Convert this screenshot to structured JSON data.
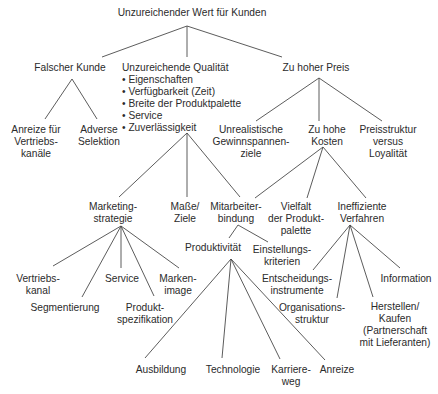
{
  "diagram": {
    "type": "issue-tree",
    "root": {
      "label": "Unzureichender Wert für Kunden"
    },
    "nodes": [
      {
        "id": "root",
        "lines": [
          "Unzureichender Wert für Kunden"
        ],
        "x": 192,
        "y": 16,
        "anchor": "middle"
      },
      {
        "id": "falscher-kunde",
        "lines": [
          "Falscher Kunde"
        ],
        "x": 70,
        "y": 71,
        "anchor": "middle"
      },
      {
        "id": "qualitaet",
        "lines": [
          "Unzureichende Qualität"
        ],
        "x": 122,
        "y": 71,
        "anchor": "start"
      },
      {
        "id": "qualitaet-bullets",
        "lines": [
          "• Eigenschaften",
          "• Verfügbarkeit (Zeit)",
          "• Breite der Produktpalette",
          "• Service",
          "• Zuverlässigkeit"
        ],
        "x": 122,
        "y": 83,
        "anchor": "start"
      },
      {
        "id": "preis",
        "lines": [
          "Zu hoher Preis"
        ],
        "x": 316,
        "y": 71,
        "anchor": "middle"
      },
      {
        "id": "anreize-vertrieb",
        "lines": [
          "Anreize für",
          "Vertriebs-",
          "kanäle"
        ],
        "x": 36,
        "y": 133,
        "anchor": "middle"
      },
      {
        "id": "adverse",
        "lines": [
          "Adverse",
          "Selektion"
        ],
        "x": 99,
        "y": 133,
        "anchor": "middle"
      },
      {
        "id": "gewinn",
        "lines": [
          "Unrealistische",
          "Gewinnspannen-",
          "ziele"
        ],
        "x": 251,
        "y": 133,
        "anchor": "middle"
      },
      {
        "id": "kosten",
        "lines": [
          "Zu hohe",
          "Kosten"
        ],
        "x": 327,
        "y": 133,
        "anchor": "middle"
      },
      {
        "id": "preisstruktur",
        "lines": [
          "Preisstruktur",
          "versus",
          "Loyalität"
        ],
        "x": 388,
        "y": 133,
        "anchor": "middle"
      },
      {
        "id": "marketing",
        "lines": [
          "Marketing-",
          "strategie"
        ],
        "x": 113,
        "y": 210,
        "anchor": "middle"
      },
      {
        "id": "masse",
        "lines": [
          "Maße/",
          "Ziele"
        ],
        "x": 185,
        "y": 210,
        "anchor": "middle"
      },
      {
        "id": "mitarbeiter",
        "lines": [
          "Mitarbeiter-",
          "bindung"
        ],
        "x": 236,
        "y": 210,
        "anchor": "middle"
      },
      {
        "id": "vielfalt",
        "lines": [
          "Vielfalt",
          "der Produkt-",
          "palette"
        ],
        "x": 296,
        "y": 210,
        "anchor": "middle"
      },
      {
        "id": "verfahren",
        "lines": [
          "Ineffiziente",
          "Verfahren"
        ],
        "x": 362,
        "y": 210,
        "anchor": "middle"
      },
      {
        "id": "produktivitaet",
        "lines": [
          "Produktivität"
        ],
        "x": 213,
        "y": 251,
        "anchor": "middle"
      },
      {
        "id": "einstellung",
        "lines": [
          "Einstellungs-",
          "kriterien"
        ],
        "x": 282,
        "y": 253,
        "anchor": "middle"
      },
      {
        "id": "vertriebskanal",
        "lines": [
          "Vertriebs-",
          "kanal"
        ],
        "x": 38,
        "y": 282,
        "anchor": "middle"
      },
      {
        "id": "segmentierung",
        "lines": [
          "Segmentierung"
        ],
        "x": 65,
        "y": 311,
        "anchor": "middle"
      },
      {
        "id": "service",
        "lines": [
          "Service"
        ],
        "x": 122,
        "y": 282,
        "anchor": "middle"
      },
      {
        "id": "produktspez",
        "lines": [
          "Produkt-",
          "spezifikation"
        ],
        "x": 145,
        "y": 311,
        "anchor": "middle"
      },
      {
        "id": "markenimage",
        "lines": [
          "Marken-",
          "image"
        ],
        "x": 178,
        "y": 282,
        "anchor": "middle"
      },
      {
        "id": "entscheidung",
        "lines": [
          "Entscheidungs-",
          "instrumente"
        ],
        "x": 297,
        "y": 282,
        "anchor": "middle"
      },
      {
        "id": "organisation",
        "lines": [
          "Organisations-",
          "struktur"
        ],
        "x": 312,
        "y": 311,
        "anchor": "middle"
      },
      {
        "id": "information",
        "lines": [
          "Information"
        ],
        "x": 406,
        "y": 282,
        "anchor": "middle"
      },
      {
        "id": "herstellen",
        "lines": [
          "Herstellen/",
          "Kaufen",
          "(Partnerschaft",
          "mit Lieferanten)"
        ],
        "x": 395,
        "y": 310,
        "anchor": "middle"
      },
      {
        "id": "ausbildung",
        "lines": [
          "Ausbildung"
        ],
        "x": 161,
        "y": 373,
        "anchor": "middle"
      },
      {
        "id": "technologie",
        "lines": [
          "Technologie"
        ],
        "x": 233,
        "y": 373,
        "anchor": "middle"
      },
      {
        "id": "karriere",
        "lines": [
          "Karriere-",
          "weg"
        ],
        "x": 291,
        "y": 373,
        "anchor": "middle"
      },
      {
        "id": "anreize",
        "lines": [
          "Anreize"
        ],
        "x": 337,
        "y": 373,
        "anchor": "middle"
      }
    ],
    "edges": [
      {
        "from": "root",
        "to": "falscher-kunde",
        "x1": 187,
        "y1": 26,
        "x2": 102,
        "y2": 57
      },
      {
        "from": "root",
        "to": "qualitaet",
        "x1": 187,
        "y1": 26,
        "x2": 187,
        "y2": 57
      },
      {
        "from": "root",
        "to": "preis",
        "x1": 187,
        "y1": 26,
        "x2": 282,
        "y2": 57
      },
      {
        "from": "falscher-kunde",
        "to": "anreize-vertrieb",
        "x1": 72,
        "y1": 79,
        "x2": 45,
        "y2": 119
      },
      {
        "from": "falscher-kunde",
        "to": "adverse",
        "x1": 72,
        "y1": 79,
        "x2": 97,
        "y2": 119
      },
      {
        "from": "preis",
        "to": "gewinn",
        "x1": 319,
        "y1": 78,
        "x2": 256,
        "y2": 121
      },
      {
        "from": "preis",
        "to": "kosten",
        "x1": 319,
        "y1": 78,
        "x2": 319,
        "y2": 121
      },
      {
        "from": "preis",
        "to": "preisstruktur",
        "x1": 319,
        "y1": 78,
        "x2": 382,
        "y2": 121
      },
      {
        "from": "qualitaet",
        "to": "marketing",
        "x1": 187,
        "y1": 133,
        "x2": 119,
        "y2": 197
      },
      {
        "from": "qualitaet",
        "to": "masse",
        "x1": 187,
        "y1": 133,
        "x2": 187,
        "y2": 197
      },
      {
        "from": "qualitaet",
        "to": "mitarbeiter",
        "x1": 187,
        "y1": 133,
        "x2": 240,
        "y2": 197
      },
      {
        "from": "kosten",
        "to": "mitarbeiter",
        "x1": 323,
        "y1": 147,
        "x2": 255,
        "y2": 198
      },
      {
        "from": "kosten",
        "to": "vielfalt",
        "x1": 323,
        "y1": 147,
        "x2": 307,
        "y2": 198
      },
      {
        "from": "kosten",
        "to": "verfahren",
        "x1": 323,
        "y1": 147,
        "x2": 366,
        "y2": 198
      },
      {
        "from": "mitarbeiter",
        "to": "produktivitaet",
        "x1": 238,
        "y1": 225,
        "x2": 229,
        "y2": 238
      },
      {
        "from": "mitarbeiter",
        "to": "einstellung",
        "x1": 238,
        "y1": 225,
        "x2": 268,
        "y2": 242
      },
      {
        "from": "marketing",
        "to": "vertriebskanal",
        "x1": 121,
        "y1": 226,
        "x2": 53,
        "y2": 266
      },
      {
        "from": "marketing",
        "to": "segmentierung",
        "x1": 121,
        "y1": 226,
        "x2": 82,
        "y2": 297
      },
      {
        "from": "marketing",
        "to": "service",
        "x1": 121,
        "y1": 226,
        "x2": 121,
        "y2": 268
      },
      {
        "from": "marketing",
        "to": "produktspez",
        "x1": 121,
        "y1": 226,
        "x2": 154,
        "y2": 296
      },
      {
        "from": "marketing",
        "to": "markenimage",
        "x1": 121,
        "y1": 226,
        "x2": 179,
        "y2": 268
      },
      {
        "from": "verfahren",
        "to": "entscheidung",
        "x1": 350,
        "y1": 225,
        "x2": 313,
        "y2": 270
      },
      {
        "from": "verfahren",
        "to": "organisation",
        "x1": 350,
        "y1": 225,
        "x2": 337,
        "y2": 298
      },
      {
        "from": "verfahren",
        "to": "herstellen",
        "x1": 350,
        "y1": 225,
        "x2": 373,
        "y2": 297
      },
      {
        "from": "verfahren",
        "to": "information",
        "x1": 350,
        "y1": 225,
        "x2": 400,
        "y2": 268
      },
      {
        "from": "produktivitaet",
        "to": "ausbildung",
        "x1": 231,
        "y1": 259,
        "x2": 145,
        "y2": 358
      },
      {
        "from": "produktivitaet",
        "to": "technologie",
        "x1": 231,
        "y1": 259,
        "x2": 222,
        "y2": 358
      },
      {
        "from": "produktivitaet",
        "to": "karriere",
        "x1": 231,
        "y1": 259,
        "x2": 280,
        "y2": 359
      },
      {
        "from": "produktivitaet",
        "to": "anreize",
        "x1": 231,
        "y1": 259,
        "x2": 325,
        "y2": 360
      }
    ],
    "colors": {
      "background": "#ffffff",
      "line": "#4a4a4a",
      "text": "#2b2b2b"
    },
    "line_height": 12
  }
}
